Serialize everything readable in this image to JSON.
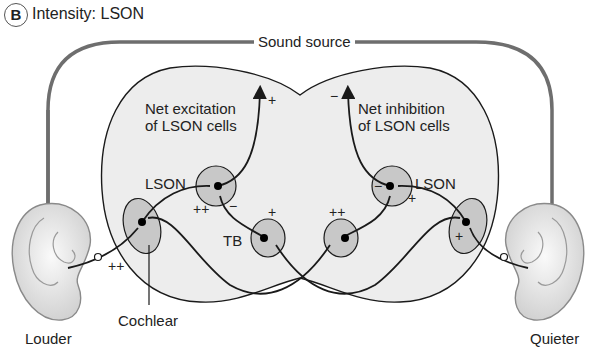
{
  "panel": {
    "letter": "B",
    "title": "Intensity: LSON"
  },
  "labels": {
    "sound_source": "Sound source",
    "net_excitation_line1": "Net excitation",
    "net_excitation_line2": "of LSON cells",
    "net_inhibition_line1": "Net inhibition",
    "net_inhibition_line2": "of LSON cells",
    "lson_left": "LSON",
    "lson_right": "LSON",
    "tb": "TB",
    "cochlear": "Cochlear",
    "louder": "Louder",
    "quieter": "Quieter"
  },
  "signs": {
    "left_output": "+",
    "right_output": "−",
    "left_lson_excit": "++",
    "left_lson_inhib": "−",
    "left_tb": "+",
    "right_tb": "++",
    "right_lson_excit": "+",
    "right_lson_inhib": "−",
    "left_ear_nerve": "++",
    "right_cochlear": "+"
  },
  "colors": {
    "brainstem_fill": "#ededed",
    "nucleus_fill": "#c8c8c8",
    "sound_path": "#6e6e6e",
    "line": "#1a1a1a"
  }
}
